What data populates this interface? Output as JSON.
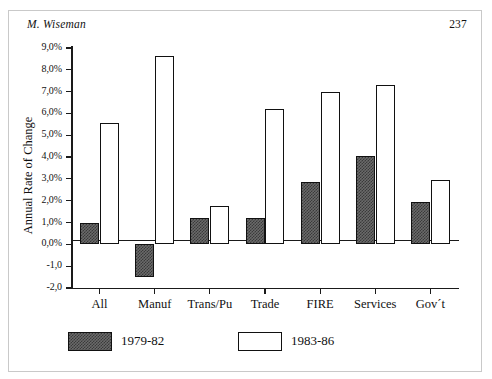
{
  "page": {
    "running_head": "M. Wiseman",
    "page_number": "237"
  },
  "chart_data": {
    "type": "bar",
    "title": "",
    "xlabel": "",
    "ylabel": "Annual Rate of Change",
    "ylim": [
      -2.0,
      9.0
    ],
    "grid": false,
    "legend_position": "bottom-left",
    "categories": [
      "All",
      "Manuf",
      "Trans/Pu",
      "Trade",
      "FIRE",
      "Services",
      "Gov´t"
    ],
    "ytick_labels": [
      "9,0%",
      "8,0%",
      "7,0%",
      "6,0%",
      "5,0%",
      "4,0%",
      "3,0%",
      "2,0%",
      "1,0%",
      "0,0%",
      "-1,0",
      "-2,0"
    ],
    "ytick_values": [
      9.0,
      8.0,
      7.0,
      6.0,
      5.0,
      4.0,
      3.0,
      2.0,
      1.0,
      0.0,
      -1.0,
      -2.0
    ],
    "series": [
      {
        "name": "1979-82",
        "fill": "hatched-dark",
        "color": "#6a6a6a",
        "values": [
          1.0,
          -1.5,
          1.2,
          1.2,
          2.85,
          4.05,
          1.95
        ]
      },
      {
        "name": "1983-86",
        "fill": "white",
        "color": "#ffffff",
        "values": [
          5.55,
          8.65,
          1.75,
          6.2,
          7.0,
          7.3,
          2.95
        ]
      }
    ]
  },
  "legend": {
    "entries": [
      {
        "label": "1979-82"
      },
      {
        "label": "1983-86"
      }
    ]
  }
}
